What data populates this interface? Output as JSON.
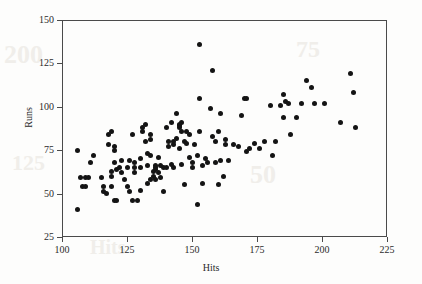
{
  "figure": {
    "background_color": "#fdfdfc",
    "frame_color": "#4a4a4a",
    "marker_color": "#141414",
    "watermarks": [
      "200",
      "75",
      "125",
      "50",
      "Hits"
    ]
  },
  "chart_data": {
    "type": "scatter",
    "title": "",
    "xlabel": "Hits",
    "ylabel": "Runs",
    "xlim": [
      100,
      225
    ],
    "ylim": [
      25,
      150
    ],
    "xticks": [
      100,
      125,
      150,
      175,
      200,
      225
    ],
    "yticks": [
      25,
      50,
      75,
      100,
      125,
      150
    ],
    "xtick_labels": [
      "100",
      "125",
      "150",
      "175",
      "200",
      "225"
    ],
    "ytick_labels": [
      "25",
      "50",
      "75",
      "100",
      "125",
      "150"
    ],
    "grid": false,
    "legend": null,
    "marker": "filled-circle",
    "marker_size": 5,
    "n_points": 141,
    "points": [
      [
        106,
        75
      ],
      [
        106,
        41
      ],
      [
        107,
        59
      ],
      [
        108,
        54
      ],
      [
        109,
        54
      ],
      [
        109,
        59
      ],
      [
        110,
        59
      ],
      [
        111,
        68
      ],
      [
        112,
        72
      ],
      [
        115,
        59
      ],
      [
        116,
        54
      ],
      [
        116,
        51
      ],
      [
        117,
        50
      ],
      [
        118,
        78
      ],
      [
        118,
        84
      ],
      [
        119,
        86
      ],
      [
        119,
        63
      ],
      [
        119,
        60
      ],
      [
        119,
        54
      ],
      [
        120,
        77
      ],
      [
        120,
        75
      ],
      [
        120,
        68
      ],
      [
        120,
        46
      ],
      [
        121,
        46
      ],
      [
        121,
        64
      ],
      [
        122,
        65
      ],
      [
        123,
        69
      ],
      [
        123,
        62
      ],
      [
        124,
        58
      ],
      [
        125,
        54
      ],
      [
        125,
        65
      ],
      [
        126,
        51
      ],
      [
        126,
        69
      ],
      [
        127,
        46
      ],
      [
        127,
        84
      ],
      [
        128,
        68
      ],
      [
        128,
        65
      ],
      [
        128,
        62
      ],
      [
        129,
        46
      ],
      [
        130,
        70
      ],
      [
        130,
        65
      ],
      [
        130,
        52
      ],
      [
        131,
        86
      ],
      [
        131,
        88
      ],
      [
        132,
        90
      ],
      [
        132,
        80
      ],
      [
        133,
        73
      ],
      [
        133,
        66
      ],
      [
        133,
        56
      ],
      [
        134,
        84
      ],
      [
        134,
        81
      ],
      [
        134,
        72
      ],
      [
        134,
        58
      ],
      [
        135,
        63
      ],
      [
        135,
        60
      ],
      [
        136,
        64
      ],
      [
        136,
        66
      ],
      [
        136,
        65
      ],
      [
        136,
        58
      ],
      [
        137,
        71
      ],
      [
        137,
        62
      ],
      [
        138,
        66
      ],
      [
        138,
        59
      ],
      [
        139,
        65
      ],
      [
        139,
        51
      ],
      [
        140,
        88
      ],
      [
        140,
        65
      ],
      [
        141,
        80
      ],
      [
        141,
        77
      ],
      [
        142,
        91
      ],
      [
        142,
        67
      ],
      [
        143,
        80
      ],
      [
        143,
        78
      ],
      [
        143,
        65
      ],
      [
        144,
        96
      ],
      [
        144,
        82
      ],
      [
        145,
        90
      ],
      [
        145,
        89
      ],
      [
        145,
        88
      ],
      [
        145,
        76
      ],
      [
        146,
        91
      ],
      [
        146,
        86
      ],
      [
        146,
        67
      ],
      [
        147,
        80
      ],
      [
        147,
        55
      ],
      [
        148,
        86
      ],
      [
        148,
        79
      ],
      [
        149,
        84
      ],
      [
        149,
        71
      ],
      [
        150,
        68
      ],
      [
        150,
        65
      ],
      [
        151,
        78
      ],
      [
        152,
        72
      ],
      [
        152,
        44
      ],
      [
        153,
        136
      ],
      [
        153,
        105
      ],
      [
        153,
        86
      ],
      [
        154,
        66
      ],
      [
        154,
        56
      ],
      [
        155,
        70
      ],
      [
        156,
        68
      ],
      [
        157,
        99
      ],
      [
        158,
        121
      ],
      [
        158,
        83
      ],
      [
        159,
        80
      ],
      [
        159,
        68
      ],
      [
        160,
        86
      ],
      [
        160,
        55
      ],
      [
        161,
        96
      ],
      [
        161,
        69
      ],
      [
        162,
        60
      ],
      [
        163,
        78
      ],
      [
        163,
        81
      ],
      [
        164,
        69
      ],
      [
        166,
        78
      ],
      [
        168,
        77
      ],
      [
        169,
        95
      ],
      [
        170,
        105
      ],
      [
        171,
        105
      ],
      [
        171,
        74
      ],
      [
        172,
        76
      ],
      [
        174,
        79
      ],
      [
        176,
        76
      ],
      [
        178,
        80
      ],
      [
        180,
        101
      ],
      [
        181,
        72
      ],
      [
        182,
        80
      ],
      [
        184,
        101
      ],
      [
        185,
        107
      ],
      [
        185,
        94
      ],
      [
        186,
        103
      ],
      [
        187,
        102
      ],
      [
        188,
        84
      ],
      [
        190,
        94
      ],
      [
        192,
        102
      ],
      [
        194,
        115
      ],
      [
        196,
        111
      ],
      [
        197,
        102
      ],
      [
        201,
        102
      ],
      [
        207,
        91
      ],
      [
        211,
        119
      ],
      [
        212,
        108
      ],
      [
        213,
        88
      ]
    ]
  }
}
